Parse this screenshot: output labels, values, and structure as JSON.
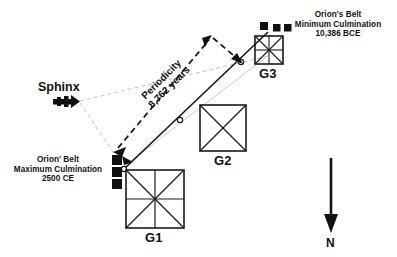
{
  "figure": {
    "title_visible": false,
    "background_color": "#ffffff",
    "line_color": "#1a1a1a",
    "guide_color": "#b9b9b9",
    "star_color": "#111111"
  },
  "pyramids": [
    {
      "id": "g1",
      "label": "G1",
      "style": "square-with-diagonals-and-cross"
    },
    {
      "id": "g2",
      "label": "G2",
      "style": "square-with-diagonals"
    },
    {
      "id": "g3",
      "label": "G3",
      "style": "square-with-diagonals-and-cross"
    }
  ],
  "sphinx": {
    "label": "Sphinx",
    "icon": "sphinx-glyph"
  },
  "callouts": {
    "minimum": {
      "line1": "Orion's Belt",
      "line2": "Minimum Culmination",
      "line3": "10,386 BCE",
      "stars": 3,
      "star_arrangement": "horizontal"
    },
    "maximum": {
      "line1": "Orion' Belt",
      "line2": "Maximum Culmination",
      "line3": "2500 CE",
      "stars": 3,
      "star_arrangement": "vertical"
    }
  },
  "periodicity": {
    "line1": "Periodicity",
    "line2": "8,762 years",
    "annotation_type": "double-headed-dashed-arrow"
  },
  "compass": {
    "direction_label": "N",
    "arrow_direction": "down",
    "icon": "north-arrow-icon"
  }
}
